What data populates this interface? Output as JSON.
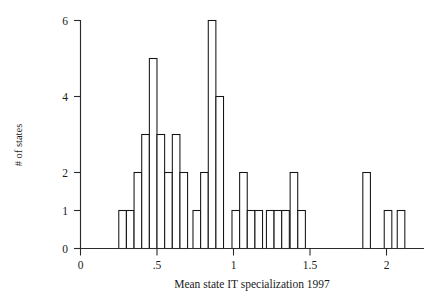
{
  "chart_data": {
    "type": "bar",
    "title": "",
    "subtitle": "",
    "xlabel": "Mean state IT specialization 1997",
    "ylabel": "# of states",
    "xlim": [
      0,
      2.18
    ],
    "ylim": [
      0,
      6
    ],
    "xticks": [
      0,
      0.5,
      1,
      1.5,
      2
    ],
    "xtick_labels": [
      "0",
      ".5",
      "1",
      "1.5",
      "2"
    ],
    "yticks": [
      0,
      1,
      2,
      4,
      6
    ],
    "ytick_labels": [
      "0",
      "1",
      "2",
      "4",
      "6"
    ],
    "grid": false,
    "legend": null,
    "bin_width": 0.05,
    "categories": [
      "0.275",
      "0.325",
      "0.375",
      "0.425",
      "0.475",
      "0.525",
      "0.575",
      "0.625",
      "0.675",
      "0.725",
      "0.775",
      "0.825",
      "0.875",
      "0.925",
      "1.025",
      "1.075",
      "1.125",
      "1.225",
      "1.275",
      "1.325",
      "1.375",
      "1.425",
      "1.875",
      "2.015",
      "2.105"
    ],
    "values": [
      1,
      1,
      2,
      3,
      5,
      3,
      2,
      3,
      2,
      1,
      1,
      2,
      6,
      4,
      1,
      2,
      1,
      1,
      1,
      1,
      2,
      1,
      2,
      1,
      1
    ],
    "bars": [
      {
        "x": 0.275,
        "value": 1
      },
      {
        "x": 0.325,
        "value": 1
      },
      {
        "x": 0.375,
        "value": 2
      },
      {
        "x": 0.425,
        "value": 3
      },
      {
        "x": 0.475,
        "value": 5
      },
      {
        "x": 0.525,
        "value": 3
      },
      {
        "x": 0.575,
        "value": 2
      },
      {
        "x": 0.625,
        "value": 3
      },
      {
        "x": 0.675,
        "value": 2
      },
      {
        "x": 0.76,
        "value": 1
      },
      {
        "x": 0.81,
        "value": 2
      },
      {
        "x": 0.86,
        "value": 6
      },
      {
        "x": 0.91,
        "value": 4
      },
      {
        "x": 1.015,
        "value": 1
      },
      {
        "x": 1.065,
        "value": 2
      },
      {
        "x": 1.115,
        "value": 1
      },
      {
        "x": 1.165,
        "value": 1
      },
      {
        "x": 1.24,
        "value": 1
      },
      {
        "x": 1.29,
        "value": 1
      },
      {
        "x": 1.34,
        "value": 1
      },
      {
        "x": 1.395,
        "value": 2
      },
      {
        "x": 1.445,
        "value": 1
      },
      {
        "x": 1.87,
        "value": 2
      },
      {
        "x": 2.01,
        "value": 1
      },
      {
        "x": 2.095,
        "value": 1
      }
    ],
    "colors": {
      "bar_fill": "#ffffff",
      "bar_stroke": "#141414",
      "axis": "#2b2b2b",
      "text": "#1a1a1a",
      "background": "#ffffff"
    }
  }
}
